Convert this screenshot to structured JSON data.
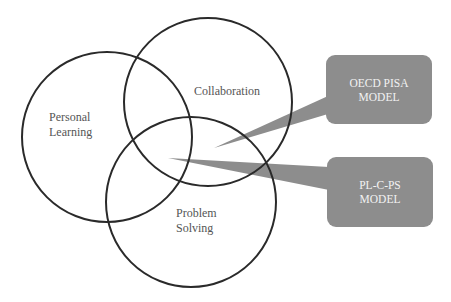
{
  "diagram": {
    "type": "venn",
    "circles": [
      {
        "id": "personal-learning",
        "label_lines": [
          "Personal",
          "Learning"
        ],
        "cx": 107,
        "cy": 137,
        "r": 85
      },
      {
        "id": "collaboration",
        "label_lines": [
          "Collaboration"
        ],
        "cx": 208,
        "cy": 102,
        "r": 84
      },
      {
        "id": "problem-solving",
        "label_lines": [
          "Problem",
          "Solving"
        ],
        "cx": 191,
        "cy": 202,
        "r": 85
      }
    ],
    "callouts": [
      {
        "id": "oecd-pisa",
        "text_lines": [
          "OECD PISA",
          "MODEL"
        ],
        "points_to": "collaboration ∩ problem-solving"
      },
      {
        "id": "pl-c-ps",
        "text_lines": [
          "PL-C-PS",
          "MODEL"
        ],
        "points_to": "personal-learning ∩ collaboration ∩ problem-solving"
      }
    ],
    "colors": {
      "circle_stroke": "#2a2a2a",
      "label_text": "#555555",
      "callout_fill": "#8d8d8d",
      "callout_text": "#f2f2f2"
    }
  }
}
